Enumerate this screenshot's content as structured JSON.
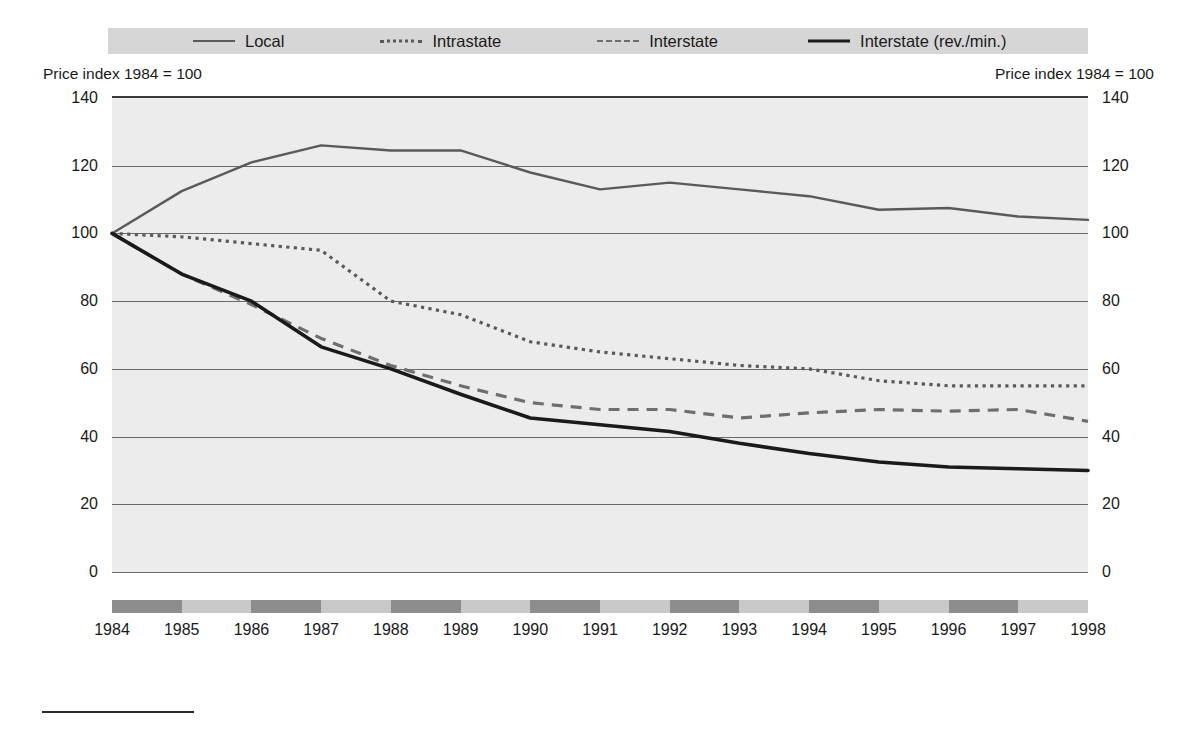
{
  "legend": {
    "items": [
      {
        "label": "Local",
        "style": "solid-gray",
        "icon": "line-solid-gray-icon"
      },
      {
        "label": "Intrastate",
        "style": "dotted",
        "icon": "line-dotted-icon"
      },
      {
        "label": "Interstate",
        "style": "dashed",
        "icon": "line-dashed-icon"
      },
      {
        "label": "Interstate (rev./min.)",
        "style": "solid-black",
        "icon": "line-solid-black-icon"
      }
    ],
    "background_color": "#d6d6d6"
  },
  "axis_captions": {
    "left": "Price index 1984 = 100",
    "right": "Price index 1984 = 100"
  },
  "colors": {
    "plot_background": "#ececec",
    "gridline": "#6a6a6a",
    "local": "#5a5a5a",
    "intrastate": "#5a5a5a",
    "interstate": "#6e6e6e",
    "interstate_rev": "#1a1a1a",
    "xband_dark": "#8d8d8d",
    "xband_light": "#c8c8c8"
  },
  "chart_data": {
    "type": "line",
    "title": "",
    "subtitle": "",
    "xlabel": "",
    "ylabel": "Price index 1984 = 100",
    "y2label": "Price index 1984 = 100",
    "xlim": [
      1984,
      1998
    ],
    "ylim": [
      0,
      140
    ],
    "yticks": [
      0,
      20,
      40,
      60,
      80,
      100,
      120,
      140
    ],
    "grid": true,
    "legend_position": "top",
    "categories": [
      1984,
      1985,
      1986,
      1987,
      1988,
      1989,
      1990,
      1991,
      1992,
      1993,
      1994,
      1995,
      1996,
      1997,
      1998
    ],
    "tick_labels": [
      "1984",
      "1985",
      "1986",
      "1987",
      "1988",
      "1989",
      "1990",
      "1991",
      "1992",
      "1993",
      "1994",
      "1995",
      "1996",
      "1997",
      "1998"
    ],
    "series": [
      {
        "name": "Local",
        "style": "solid-gray",
        "values": [
          100,
          112.5,
          121,
          126,
          124.5,
          124.5,
          118,
          113,
          115,
          113,
          111,
          107,
          107.5,
          105,
          104
        ]
      },
      {
        "name": "Intrastate",
        "style": "dotted",
        "values": [
          100,
          99,
          97,
          95,
          80,
          76,
          68,
          65,
          63,
          61,
          60,
          56.5,
          55,
          55,
          55
        ]
      },
      {
        "name": "Interstate",
        "style": "dashed",
        "values": [
          100,
          88,
          79,
          69,
          61,
          55,
          50,
          48,
          48,
          45.5,
          47,
          48,
          47.5,
          48,
          44.5
        ]
      },
      {
        "name": "Interstate (rev./min.)",
        "style": "solid-black",
        "values": [
          100,
          88,
          80,
          66.5,
          60,
          52.5,
          45.5,
          43.5,
          41.5,
          38,
          35,
          32.5,
          31,
          30.5,
          30
        ]
      }
    ]
  }
}
